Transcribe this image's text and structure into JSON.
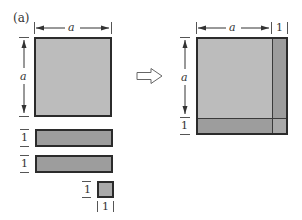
{
  "figure": {
    "panel_label": "(a)",
    "left": {
      "square": {
        "width_label": "a",
        "height_label": "a",
        "color": "#bcbcbc"
      },
      "bar1": {
        "height_label": "1",
        "color": "#9d9d9d"
      },
      "bar2": {
        "height_label": "1",
        "color": "#9d9d9d"
      },
      "small_square": {
        "height_label": "1",
        "width_label": "1",
        "color": "#a9a9a9"
      }
    },
    "arrow": {
      "direction": "right",
      "style": "hollow"
    },
    "right": {
      "composite_square": {
        "width_label_a": "a",
        "width_label_1": "1",
        "height_label_a": "a",
        "height_label_1": "1",
        "main_color": "#bcbcbc",
        "strip_color": "#9d9d9d",
        "corner_color": "#a9a9a9"
      }
    }
  }
}
